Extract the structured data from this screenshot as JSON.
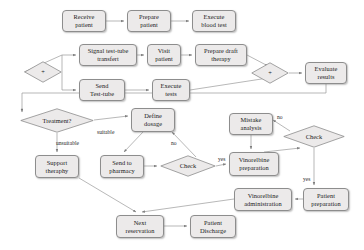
{
  "diagram": {
    "style": {
      "node_fill": "#eceaea",
      "node_stroke": "#8d8d8d",
      "edge_color": "#7d7d7d",
      "text_color": "#1a1a1a"
    },
    "nodes": [
      {
        "id": "receive_patient",
        "type": "process",
        "label_lines": [
          "Receive",
          "patient"
        ],
        "x": 62,
        "y": 10,
        "w": 44,
        "h": 22
      },
      {
        "id": "prepare_patient",
        "type": "process",
        "label_lines": [
          "Prepare",
          "patient"
        ],
        "x": 127,
        "y": 10,
        "w": 44,
        "h": 22
      },
      {
        "id": "execute_blood_test",
        "type": "process",
        "label_lines": [
          "Execute",
          "blood test"
        ],
        "x": 192,
        "y": 10,
        "w": 44,
        "h": 22
      },
      {
        "id": "merge_left",
        "type": "merge",
        "label_lines": [
          "+"
        ],
        "x": 24,
        "y": 61,
        "w": 38,
        "h": 22
      },
      {
        "id": "signal_test_tube",
        "type": "process",
        "label_lines": [
          "Signal test-tube",
          "transfert"
        ],
        "x": 79,
        "y": 44,
        "w": 58,
        "h": 22
      },
      {
        "id": "visit_patient",
        "type": "process",
        "label_lines": [
          "Visit",
          "patient"
        ],
        "x": 147,
        "y": 44,
        "w": 34,
        "h": 22
      },
      {
        "id": "prepare_draft_therapy",
        "type": "process",
        "label_lines": [
          "Prepare draft",
          "therapy"
        ],
        "x": 195,
        "y": 44,
        "w": 52,
        "h": 22
      },
      {
        "id": "send_test_tube",
        "type": "process",
        "label_lines": [
          "Send",
          "Test-tube"
        ],
        "x": 79,
        "y": 79,
        "w": 46,
        "h": 22
      },
      {
        "id": "execute_tests",
        "type": "process",
        "label_lines": [
          "Execute",
          "tests"
        ],
        "x": 152,
        "y": 79,
        "w": 38,
        "h": 22
      },
      {
        "id": "merge_right",
        "type": "merge",
        "label_lines": [
          "+"
        ],
        "x": 251,
        "y": 62,
        "w": 38,
        "h": 22
      },
      {
        "id": "evaluate_results",
        "type": "process",
        "label_lines": [
          "Evaluate",
          "results"
        ],
        "x": 305,
        "y": 62,
        "w": 42,
        "h": 22
      },
      {
        "id": "treatment_decision",
        "type": "decision",
        "label_lines": [
          "Treatment?"
        ],
        "x": 20,
        "y": 108,
        "w": 74,
        "h": 25
      },
      {
        "id": "define_dosage",
        "type": "process",
        "label_lines": [
          "Define",
          "dosage"
        ],
        "x": 131,
        "y": 108,
        "w": 44,
        "h": 24
      },
      {
        "id": "mistake_analysis",
        "type": "process",
        "label_lines": [
          "Mistake",
          "analysis"
        ],
        "x": 229,
        "y": 113,
        "w": 44,
        "h": 22
      },
      {
        "id": "check_right",
        "type": "decision",
        "label_lines": [
          "Check"
        ],
        "x": 283,
        "y": 125,
        "w": 62,
        "h": 23
      },
      {
        "id": "support_therapy",
        "type": "process",
        "label_lines": [
          "Support",
          "theraphy"
        ],
        "x": 35,
        "y": 155,
        "w": 44,
        "h": 23
      },
      {
        "id": "send_to_pharmacy",
        "type": "process",
        "label_lines": [
          "Send to",
          "pharmacy"
        ],
        "x": 100,
        "y": 155,
        "w": 44,
        "h": 23
      },
      {
        "id": "check_left",
        "type": "decision",
        "label_lines": [
          "Check"
        ],
        "x": 160,
        "y": 155,
        "w": 56,
        "h": 22
      },
      {
        "id": "vinorelbine_prep",
        "type": "process",
        "label_lines": [
          "Vinorelbine",
          "preparation"
        ],
        "x": 229,
        "y": 152,
        "w": 50,
        "h": 24
      },
      {
        "id": "vinorelbine_admin",
        "type": "process",
        "label_lines": [
          "Vinorelbine",
          "administration"
        ],
        "x": 234,
        "y": 188,
        "w": 58,
        "h": 23
      },
      {
        "id": "patient_preparation",
        "type": "process",
        "label_lines": [
          "Patient",
          "preparation"
        ],
        "x": 303,
        "y": 188,
        "w": 46,
        "h": 23
      },
      {
        "id": "next_reservation",
        "type": "process",
        "label_lines": [
          "Next",
          "reservation"
        ],
        "x": 116,
        "y": 215,
        "w": 48,
        "h": 23
      },
      {
        "id": "patient_discharge",
        "type": "process",
        "label_lines": [
          "Patient",
          "Discharge"
        ],
        "x": 190,
        "y": 215,
        "w": 46,
        "h": 23
      }
    ],
    "edge_labels": [
      {
        "id": "suitable",
        "text": "suitable",
        "x": 97,
        "y": 129
      },
      {
        "id": "unsuitable",
        "text": "unsuitable",
        "x": 56,
        "y": 140
      },
      {
        "id": "no_left",
        "text": "no",
        "x": 171,
        "y": 140
      },
      {
        "id": "yes_left",
        "text": "yes",
        "x": 218,
        "y": 156
      },
      {
        "id": "no_right",
        "text": "no",
        "x": 277,
        "y": 114
      },
      {
        "id": "yes_right",
        "text": "yes",
        "x": 303,
        "y": 176
      }
    ],
    "edges": [
      {
        "from": "receive_patient",
        "to": "prepare_patient"
      },
      {
        "from": "prepare_patient",
        "to": "execute_blood_test"
      },
      {
        "from": "merge_left",
        "to": "signal_test_tube"
      },
      {
        "from": "merge_left",
        "to": "send_test_tube"
      },
      {
        "from": "signal_test_tube",
        "to": "visit_patient"
      },
      {
        "from": "visit_patient",
        "to": "prepare_draft_therapy"
      },
      {
        "from": "send_test_tube",
        "to": "execute_tests"
      },
      {
        "from": "prepare_draft_therapy",
        "to": "merge_right"
      },
      {
        "from": "execute_tests",
        "to": "merge_right"
      },
      {
        "from": "merge_right",
        "to": "evaluate_results"
      },
      {
        "from": "evaluate_results",
        "to": "treatment_decision"
      },
      {
        "from": "treatment_decision",
        "to": "define_dosage",
        "label": "suitable"
      },
      {
        "from": "treatment_decision",
        "to": "support_therapy",
        "label": "unsuitable"
      },
      {
        "from": "define_dosage",
        "to": "send_to_pharmacy"
      },
      {
        "from": "send_to_pharmacy",
        "to": "check_left"
      },
      {
        "from": "check_left",
        "to": "define_dosage",
        "label": "no"
      },
      {
        "from": "check_left",
        "to": "vinorelbine_prep",
        "label": "yes"
      },
      {
        "from": "mistake_analysis",
        "to": "vinorelbine_prep"
      },
      {
        "from": "check_right",
        "to": "mistake_analysis",
        "label": "no"
      },
      {
        "from": "check_right",
        "to": "patient_preparation",
        "label": "yes"
      },
      {
        "from": "vinorelbine_prep",
        "to": "check_right"
      },
      {
        "from": "patient_preparation",
        "to": "vinorelbine_admin"
      },
      {
        "from": "vinorelbine_admin",
        "to": "next_reservation"
      },
      {
        "from": "support_therapy",
        "to": "next_reservation"
      },
      {
        "from": "next_reservation",
        "to": "patient_discharge"
      }
    ]
  }
}
